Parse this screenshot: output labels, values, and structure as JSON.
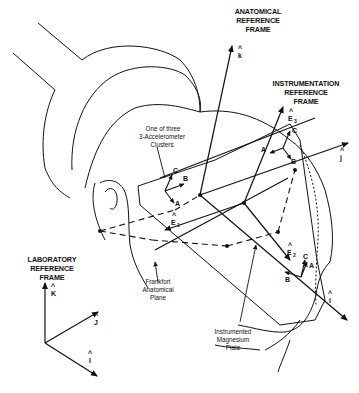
{
  "diagram": {
    "frames": {
      "anatomical": {
        "title": [
          "ANATOMICAL",
          "REFERENCE",
          "FRAME"
        ],
        "axes": {
          "k": "k",
          "j": "j",
          "i": "i"
        }
      },
      "instrumentation": {
        "title": [
          "INSTRUMENTATION",
          "REFERENCE",
          "FRAME"
        ],
        "axes": {
          "e1": "E",
          "e1_sub": "1",
          "e2": "E",
          "e2_sub": "2",
          "e3": "E",
          "e3_sub": "3"
        }
      },
      "laboratory": {
        "title": [
          "LABORATORY",
          "REFERENCE",
          "FRAME"
        ],
        "axes": {
          "K": "K",
          "J": "J",
          "I": "I"
        }
      }
    },
    "callouts": {
      "cluster": [
        "One of three",
        "3-Accelerometer",
        "Clusters"
      ],
      "frankfort": [
        "Frankfort",
        "Anatomical",
        "Plane"
      ],
      "plate": [
        "Instrumented",
        "Magnesium",
        "Plate"
      ]
    },
    "cluster_points": {
      "a": "A",
      "b": "B",
      "c": "C"
    },
    "hat": "^"
  }
}
